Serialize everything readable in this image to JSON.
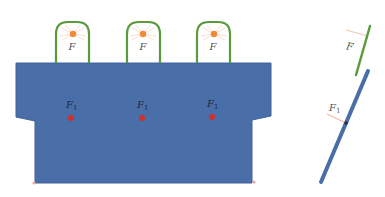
{
  "colors": {
    "board": "#4a6fa8",
    "board_edge": "#3f629a",
    "clip": "#5a9a3c",
    "clip_force_dot": "#f08a3a",
    "board_force_dot": "#d0312a",
    "force_line": "#f2b8a8",
    "label_on_white": "#555555",
    "label_on_board": "#1d2b44",
    "contact_point": "#1d2b44"
  },
  "front_view": {
    "clips": [
      {
        "label": "F"
      },
      {
        "label": "F"
      },
      {
        "label": "F"
      }
    ],
    "board_forces": [
      {
        "label": "F",
        "subscript": "1"
      },
      {
        "label": "F",
        "subscript": "1"
      },
      {
        "label": "F",
        "subscript": "1"
      }
    ]
  },
  "side_view": {
    "clip_force": {
      "label": "F"
    },
    "board_force": {
      "label": "F",
      "subscript": "1"
    }
  }
}
